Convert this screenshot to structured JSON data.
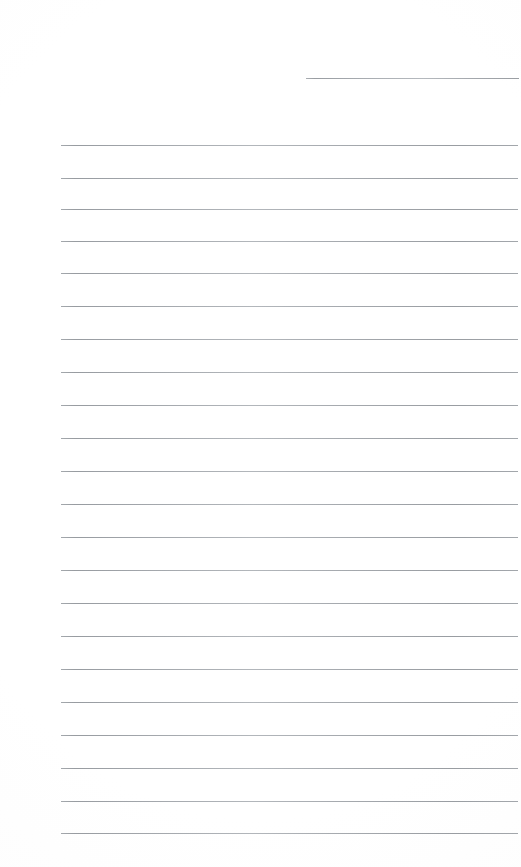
{
  "document": {
    "kind": "ruled-notepaper",
    "title": "Blank Ruled Notepaper",
    "page_width": 521,
    "page_height": 867,
    "background_color": "#ffffff",
    "rule_color": "#b6babe",
    "rule_thickness_px": 1,
    "content_text": "",
    "notes": "Blank lined writing page; no text content present."
  },
  "layout": {
    "body_rule_left_px": 61,
    "body_rule_right_px": 518,
    "header_rule_left_px": 306,
    "header_rule_right_px": 519,
    "rule_spacing_px": 32.7,
    "first_body_rule_y_px": 145,
    "last_body_rule_y_px": 833,
    "body_rule_count": 22,
    "header_rule_count": 1,
    "total_rule_count": 23
  },
  "rules": [
    {
      "id": "header-rule-1",
      "y": 78,
      "left": 306,
      "right": 519,
      "kind": "header"
    },
    {
      "id": "body-rule-1",
      "y": 145,
      "left": 61,
      "right": 518,
      "kind": "body"
    },
    {
      "id": "body-rule-2",
      "y": 178,
      "left": 61,
      "right": 518,
      "kind": "body"
    },
    {
      "id": "body-rule-3",
      "y": 209,
      "left": 61,
      "right": 518,
      "kind": "body"
    },
    {
      "id": "body-rule-4",
      "y": 241,
      "left": 61,
      "right": 518,
      "kind": "body"
    },
    {
      "id": "body-rule-5",
      "y": 273,
      "left": 61,
      "right": 518,
      "kind": "body"
    },
    {
      "id": "body-rule-6",
      "y": 306,
      "left": 61,
      "right": 518,
      "kind": "body"
    },
    {
      "id": "body-rule-7",
      "y": 339,
      "left": 61,
      "right": 518,
      "kind": "body"
    },
    {
      "id": "body-rule-8",
      "y": 372,
      "left": 61,
      "right": 518,
      "kind": "body"
    },
    {
      "id": "body-rule-9",
      "y": 405,
      "left": 61,
      "right": 518,
      "kind": "body"
    },
    {
      "id": "body-rule-10",
      "y": 438,
      "left": 61,
      "right": 518,
      "kind": "body"
    },
    {
      "id": "body-rule-11",
      "y": 471,
      "left": 61,
      "right": 518,
      "kind": "body"
    },
    {
      "id": "body-rule-12",
      "y": 504,
      "left": 61,
      "right": 518,
      "kind": "body"
    },
    {
      "id": "body-rule-13",
      "y": 537,
      "left": 61,
      "right": 518,
      "kind": "body"
    },
    {
      "id": "body-rule-14",
      "y": 570,
      "left": 61,
      "right": 518,
      "kind": "body"
    },
    {
      "id": "body-rule-15",
      "y": 603,
      "left": 61,
      "right": 518,
      "kind": "body"
    },
    {
      "id": "body-rule-16",
      "y": 636,
      "left": 61,
      "right": 518,
      "kind": "body"
    },
    {
      "id": "body-rule-17",
      "y": 669,
      "left": 61,
      "right": 518,
      "kind": "body"
    },
    {
      "id": "body-rule-18",
      "y": 702,
      "left": 61,
      "right": 518,
      "kind": "body"
    },
    {
      "id": "body-rule-19",
      "y": 735,
      "left": 61,
      "right": 518,
      "kind": "body"
    },
    {
      "id": "body-rule-20",
      "y": 768,
      "left": 61,
      "right": 518,
      "kind": "body"
    },
    {
      "id": "body-rule-21",
      "y": 801,
      "left": 61,
      "right": 518,
      "kind": "body"
    },
    {
      "id": "body-rule-22",
      "y": 833,
      "left": 61,
      "right": 518,
      "kind": "body"
    }
  ]
}
